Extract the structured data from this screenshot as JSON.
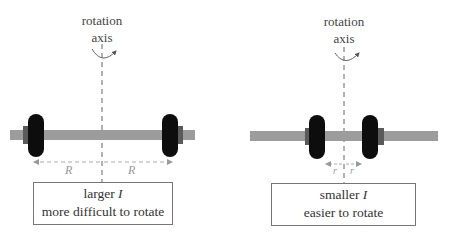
{
  "colors": {
    "bar": "#9c9c9c",
    "collar": "#5a5a5a",
    "weight": "#0d0d0d",
    "axis_line": "#666666",
    "dimension_line": "#aaaaaa",
    "box_border": "#777777"
  },
  "left_panel": {
    "axis_label_line1": "rotation",
    "axis_label_line2": "axis",
    "dimension_left": "R",
    "dimension_right": "R",
    "caption_line1_prefix": "larger ",
    "caption_line1_symbol": "I",
    "caption_line2": "more difficult to rotate"
  },
  "right_panel": {
    "axis_label_line1": "rotation",
    "axis_label_line2": "axis",
    "dimension_left": "r",
    "dimension_right": "r",
    "caption_line1_prefix": "smaller ",
    "caption_line1_symbol": "I",
    "caption_line2": "easier to rotate"
  }
}
